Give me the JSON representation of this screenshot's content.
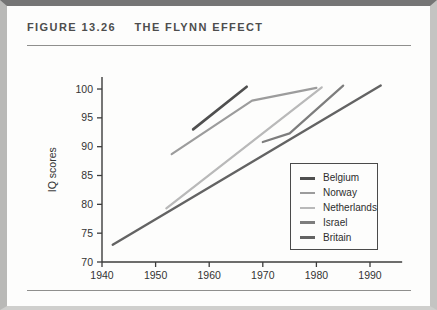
{
  "figure": {
    "label": "FIGURE 13.26",
    "title": "THE FLYNN EFFECT"
  },
  "chart_data": {
    "type": "line",
    "title": "THE FLYNN EFFECT",
    "xlabel": "",
    "ylabel": "IQ scores",
    "xlim": [
      1940,
      1996
    ],
    "ylim": [
      70,
      102
    ],
    "xticks": [
      1940,
      1950,
      1960,
      1970,
      1980,
      1990
    ],
    "yticks": [
      70,
      75,
      80,
      85,
      90,
      95,
      100
    ],
    "grid": false,
    "legend_position": "lower right",
    "axis_color": "#3c3c3c",
    "tick_label_color": "#333333",
    "series": [
      {
        "name": "Belgium",
        "color": "#4f4f4f",
        "width": 2.6,
        "points": [
          [
            1957,
            93.0
          ],
          [
            1967,
            100.4
          ]
        ]
      },
      {
        "name": "Norway",
        "color": "#9c9c9c",
        "width": 2.2,
        "points": [
          [
            1953,
            88.7
          ],
          [
            1968,
            98.0
          ],
          [
            1980,
            100.2
          ]
        ]
      },
      {
        "name": "Netherlands",
        "color": "#b9b9b9",
        "width": 2.2,
        "points": [
          [
            1952,
            79.3
          ],
          [
            1981,
            100.3
          ]
        ]
      },
      {
        "name": "Israel",
        "color": "#7d7d7d",
        "width": 2.2,
        "points": [
          [
            1970,
            90.8
          ],
          [
            1975,
            92.3
          ],
          [
            1985,
            100.6
          ]
        ]
      },
      {
        "name": "Britain",
        "color": "#636363",
        "width": 2.4,
        "points": [
          [
            1942,
            73.0
          ],
          [
            1992,
            100.6
          ]
        ]
      }
    ]
  }
}
